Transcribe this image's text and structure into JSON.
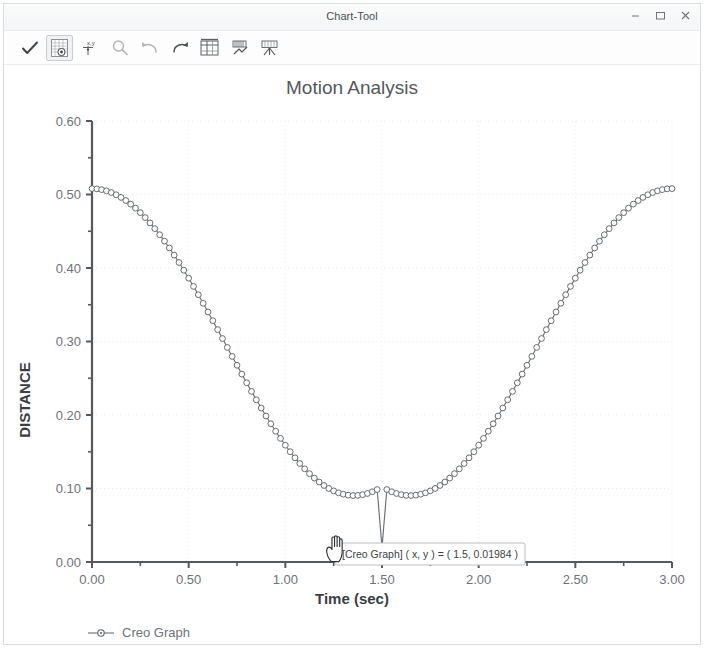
{
  "window": {
    "title": "Chart-Tool",
    "controls": [
      {
        "name": "minimize-button",
        "glyph": "minimize-icon",
        "label": "–"
      },
      {
        "name": "maximize-button",
        "glyph": "maximize-icon",
        "label": "□"
      },
      {
        "name": "close-button",
        "glyph": "close-icon",
        "label": "×"
      }
    ]
  },
  "toolbar": {
    "items": [
      {
        "name": "accept-check-button",
        "icon": "checkmark-icon",
        "state": "enabled"
      },
      {
        "name": "show-grid-button",
        "icon": "grid-table-icon",
        "state": "active"
      },
      {
        "name": "xy-point-button",
        "icon": "xy-point-icon",
        "state": "enabled"
      },
      {
        "name": "zoom-button",
        "icon": "magnifier-icon",
        "state": "disabled"
      },
      {
        "name": "undo-button",
        "icon": "undo-arrow-icon",
        "state": "disabled"
      },
      {
        "name": "redo-button",
        "icon": "redo-arrow-icon",
        "state": "enabled"
      },
      {
        "name": "table-view-button",
        "icon": "table-columns-icon",
        "state": "enabled"
      },
      {
        "name": "bar-chart-button",
        "icon": "bar-chart-icon",
        "state": "enabled"
      },
      {
        "name": "export-button",
        "icon": "export-chart-icon",
        "state": "enabled"
      }
    ]
  },
  "tooltip": {
    "text": "[Creo Graph] ( x, y ) = ( 1.5, 0.01984 )",
    "x_value": 1.5,
    "y_value": 0.01984,
    "series": "Creo Graph"
  },
  "colors": {
    "curve": "#6a6f74",
    "marker_fill": "#ffffff",
    "marker_stroke": "#5e6367",
    "axis": "#55595d",
    "grid": "#e9eef2",
    "title_text": "#54585c",
    "tick_text": "#6d7276",
    "background": "#ffffff"
  },
  "chart_data": {
    "type": "line",
    "title": "Motion Analysis",
    "xlabel": "Time (sec)",
    "ylabel": "DISTANCE",
    "xlim": [
      0,
      3
    ],
    "ylim": [
      0,
      0.6
    ],
    "xticks": [
      0,
      0.5,
      1.0,
      1.5,
      2.0,
      2.5,
      3.0
    ],
    "xtick_labels": [
      "0.00",
      "0.50",
      "1.00",
      "1.50",
      "2.00",
      "2.50",
      "3.00"
    ],
    "xtick_labels_visible": [
      "0.00",
      "0.50",
      "1.00",
      "1.50",
      "2.00",
      "2.50",
      "3.00"
    ],
    "yticks": [
      0.0,
      0.1,
      0.2,
      0.3,
      0.4,
      0.5,
      0.6
    ],
    "ytick_labels": [
      "0.00",
      "0.10",
      "0.20",
      "0.30",
      "0.40",
      "0.50",
      "0.60"
    ],
    "y_minor_ticks": [
      0.05,
      0.15,
      0.25,
      0.35,
      0.45,
      0.55
    ],
    "x_minor_ticks": [
      0.25,
      0.75,
      1.25,
      1.75,
      2.25,
      2.75
    ],
    "grid": true,
    "grid_style": "dotted",
    "legend": {
      "position": "bottom-left",
      "entries": [
        "Creo Graph"
      ]
    },
    "markers": "open-circle",
    "series": [
      {
        "name": "Creo Graph",
        "x": [
          0.0,
          0.025,
          0.05,
          0.075,
          0.1,
          0.125,
          0.15,
          0.175,
          0.2,
          0.225,
          0.25,
          0.275,
          0.3,
          0.325,
          0.35,
          0.375,
          0.4,
          0.425,
          0.45,
          0.475,
          0.5,
          0.525,
          0.55,
          0.575,
          0.6,
          0.625,
          0.65,
          0.675,
          0.7,
          0.725,
          0.75,
          0.775,
          0.8,
          0.825,
          0.85,
          0.875,
          0.9,
          0.925,
          0.95,
          0.975,
          1.0,
          1.025,
          1.05,
          1.075,
          1.1,
          1.125,
          1.15,
          1.175,
          1.2,
          1.225,
          1.25,
          1.275,
          1.3,
          1.325,
          1.35,
          1.375,
          1.4,
          1.425,
          1.45,
          1.475,
          1.5,
          1.525,
          1.55,
          1.575,
          1.6,
          1.625,
          1.65,
          1.675,
          1.7,
          1.725,
          1.75,
          1.775,
          1.8,
          1.825,
          1.85,
          1.875,
          1.9,
          1.925,
          1.95,
          1.975,
          2.0,
          2.025,
          2.05,
          2.075,
          2.1,
          2.125,
          2.15,
          2.175,
          2.2,
          2.225,
          2.25,
          2.275,
          2.3,
          2.325,
          2.35,
          2.375,
          2.4,
          2.425,
          2.45,
          2.475,
          2.5,
          2.525,
          2.55,
          2.575,
          2.6,
          2.625,
          2.65,
          2.675,
          2.7,
          2.725,
          2.75,
          2.775,
          2.8,
          2.825,
          2.85,
          2.875,
          2.9,
          2.925,
          2.95,
          2.975,
          3.0
        ],
        "y": [
          0.508,
          0.50766,
          0.50666,
          0.50499,
          0.50266,
          0.49968,
          0.49605,
          0.49179,
          0.4869,
          0.4814,
          0.4753,
          0.46862,
          0.46138,
          0.4536,
          0.4453,
          0.43651,
          0.42725,
          0.41755,
          0.40745,
          0.39697,
          0.38615,
          0.37503,
          0.36364,
          0.35202,
          0.34021,
          0.32825,
          0.31618,
          0.30404,
          0.29188,
          0.27973,
          0.26764,
          0.25565,
          0.2438,
          0.23214,
          0.22069,
          0.20951,
          0.19863,
          0.18809,
          0.17793,
          0.16818,
          0.15888,
          0.15006,
          0.14175,
          0.13398,
          0.12678,
          0.12017,
          0.11418,
          0.10882,
          0.10412,
          0.1001,
          0.09676,
          0.09412,
          0.09219,
          0.09097,
          0.09046,
          0.09067,
          0.09159,
          0.09322,
          0.09556,
          0.09858,
          0.01984,
          0.09858,
          0.09556,
          0.09322,
          0.09159,
          0.09067,
          0.09046,
          0.09097,
          0.09219,
          0.09412,
          0.09676,
          0.1001,
          0.10412,
          0.10882,
          0.11418,
          0.12017,
          0.12678,
          0.13398,
          0.14175,
          0.15006,
          0.15888,
          0.16818,
          0.17793,
          0.18809,
          0.19863,
          0.20951,
          0.22069,
          0.23214,
          0.2438,
          0.25565,
          0.26764,
          0.27973,
          0.29188,
          0.30404,
          0.31618,
          0.32825,
          0.34021,
          0.35202,
          0.36364,
          0.37503,
          0.38615,
          0.39697,
          0.40745,
          0.41755,
          0.42725,
          0.43651,
          0.4453,
          0.4536,
          0.46138,
          0.46862,
          0.4753,
          0.4814,
          0.4869,
          0.49179,
          0.49605,
          0.49968,
          0.50266,
          0.50499,
          0.50666,
          0.50766,
          0.508
        ],
        "formula_note": "y = 0.264 + 0.2441*cos(2*pi*x/3)"
      }
    ]
  }
}
